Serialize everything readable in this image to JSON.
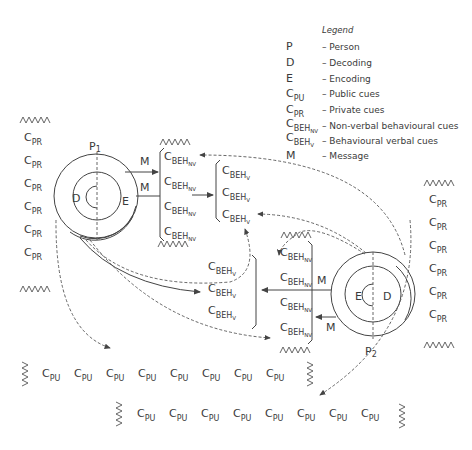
{
  "legend": {
    "title": "Legend",
    "items": [
      {
        "symbol": "P",
        "sub": "",
        "subsub": "",
        "desc": "– Person"
      },
      {
        "symbol": "D",
        "sub": "",
        "subsub": "",
        "desc": "– Decoding"
      },
      {
        "symbol": "E",
        "sub": "",
        "subsub": "",
        "desc": "– Encoding"
      },
      {
        "symbol": "C",
        "sub": "PU",
        "subsub": "",
        "desc": "– Public cues"
      },
      {
        "symbol": "C",
        "sub": "PR",
        "subsub": "",
        "desc": "– Private cues"
      },
      {
        "symbol": "C",
        "sub": "BEH",
        "subsub": "NV",
        "desc": "– Non-verbal behavioural cues"
      },
      {
        "symbol": "C",
        "sub": "BEH",
        "subsub": "V",
        "desc": "– Behavioural verbal cues"
      },
      {
        "symbol": "M",
        "sub": "",
        "subsub": "",
        "desc": "– Message"
      }
    ]
  },
  "persons": {
    "p1": {
      "label": "P",
      "index": "1",
      "decoding": "D",
      "encoding": "E"
    },
    "p2": {
      "label": "P",
      "index": "2",
      "decoding": "D",
      "encoding": "E"
    }
  },
  "message_label": "M",
  "cue": {
    "c": "C",
    "pr": "PR",
    "pu": "PU",
    "beh": "BEH",
    "nv": "NV",
    "v": "V"
  },
  "left_private_cues_count": 6,
  "right_private_cues_count": 6,
  "p1_nonverbal_cues_count": 4,
  "p1_verbal_cues_count": 3,
  "p2_verbal_cues_count": 3,
  "p2_nonverbal_cues_count": 4,
  "public_cues_row1_count": 8,
  "public_cues_row2_count": 8
}
